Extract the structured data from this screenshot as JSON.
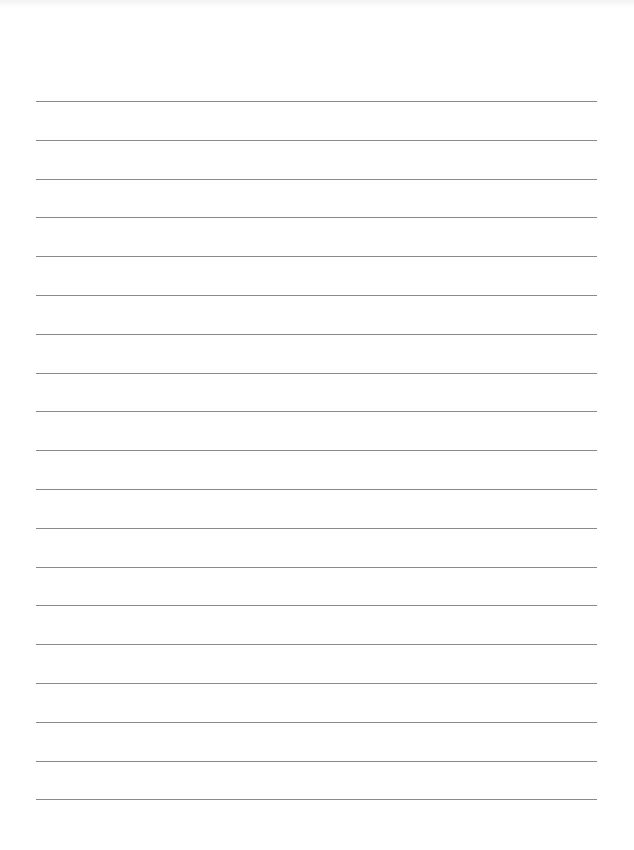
{
  "document": {
    "type": "lined-paper",
    "line_count": 19,
    "line_color": "#8a8a8a",
    "background": "#ffffff",
    "first_line_y": 101,
    "line_spacing": 38.8,
    "line_left": 36,
    "line_right": 597
  }
}
